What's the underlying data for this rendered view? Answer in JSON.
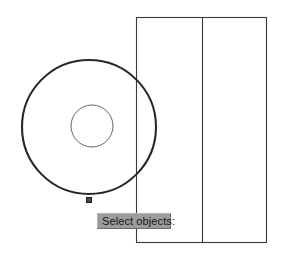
{
  "app": {
    "type": "cad-drawing-canvas",
    "background_color": "#ffffff"
  },
  "prompt": {
    "text": "Select objects:",
    "background_color": "#9c9c9c",
    "text_color": "#161616"
  },
  "drawing": {
    "stroke_color": "#231f20",
    "thin_stroke_color": "#595959",
    "shapes": [
      {
        "name": "outer-circle",
        "type": "circle",
        "cx": 89,
        "cy": 127,
        "r": 67,
        "stroke_width": 2.1,
        "selected": true
      },
      {
        "name": "inner-circle",
        "type": "circle",
        "cx": 92,
        "cy": 126,
        "r": 21,
        "stroke_width": 0.9,
        "selected": false
      },
      {
        "name": "rectangle-outline",
        "type": "rect",
        "x": 136,
        "y": 17,
        "width": 130,
        "height": 225,
        "stroke_width": 1.0
      },
      {
        "name": "rectangle-divider",
        "type": "line",
        "x1": 202,
        "y1": 17,
        "x2": 202,
        "y2": 242,
        "stroke_width": 1.0
      }
    ],
    "grip": {
      "name": "selection-grip",
      "x": 86,
      "y": 197,
      "size": 6,
      "fill_color": "#4a4a4a",
      "stroke_color": "#1a1a1a"
    }
  }
}
